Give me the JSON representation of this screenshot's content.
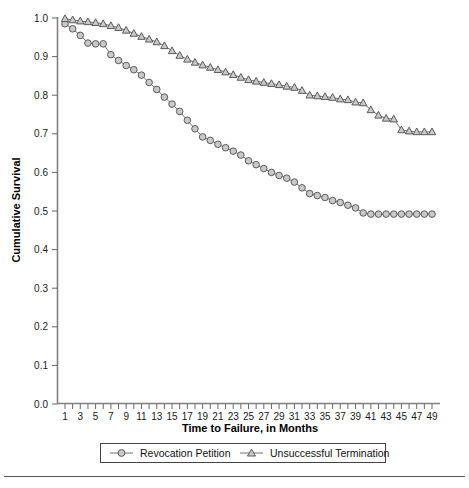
{
  "chart_data": {
    "type": "line",
    "title": "",
    "xlabel": "Time to Failure, in Months",
    "ylabel": "Cumulative Survival",
    "xlim": [
      1,
      49
    ],
    "ylim": [
      0.0,
      1.0
    ],
    "grid": false,
    "legend_position": "bottom",
    "xticks": [
      1,
      2,
      3,
      4,
      5,
      6,
      7,
      8,
      9,
      10,
      11,
      12,
      13,
      14,
      15,
      16,
      17,
      18,
      19,
      20,
      21,
      22,
      23,
      24,
      25,
      26,
      27,
      28,
      29,
      30,
      31,
      32,
      33,
      34,
      35,
      36,
      37,
      38,
      39,
      40,
      41,
      42,
      43,
      44,
      45,
      46,
      47,
      48,
      49
    ],
    "xticklabels": [
      "1",
      "",
      "3",
      "",
      "5",
      "",
      "7",
      "",
      "9",
      "",
      "11",
      "",
      "13",
      "",
      "15",
      "",
      "17",
      "",
      "19",
      "",
      "21",
      "",
      "23",
      "",
      "25",
      "",
      "27",
      "",
      "29",
      "",
      "31",
      "",
      "33",
      "",
      "35",
      "",
      "37",
      "",
      "39",
      "",
      "41",
      "",
      "43",
      "",
      "45",
      "",
      "47",
      "",
      "49"
    ],
    "yticks": [
      0.0,
      0.1,
      0.2,
      0.3,
      0.4,
      0.5,
      0.6,
      0.7,
      0.8,
      0.9,
      1.0
    ],
    "yticklabels": [
      "0.0",
      "0.1",
      "0.2",
      "0.3",
      "0.4",
      "0.5",
      "0.6",
      "0.7",
      "0.8",
      "0.9",
      "1.0"
    ],
    "x": [
      1,
      2,
      3,
      4,
      5,
      6,
      7,
      8,
      9,
      10,
      11,
      12,
      13,
      14,
      15,
      16,
      17,
      18,
      19,
      20,
      21,
      22,
      23,
      24,
      25,
      26,
      27,
      28,
      29,
      30,
      31,
      32,
      33,
      34,
      35,
      36,
      37,
      38,
      39,
      40,
      41,
      42,
      43,
      44,
      45,
      46,
      47,
      48,
      49
    ],
    "series": [
      {
        "name": "Revocation Petition",
        "marker": "circle",
        "color": "#6f6f6f",
        "values": [
          0.985,
          0.972,
          0.955,
          0.935,
          0.933,
          0.933,
          0.905,
          0.89,
          0.877,
          0.866,
          0.852,
          0.833,
          0.815,
          0.795,
          0.777,
          0.758,
          0.735,
          0.713,
          0.692,
          0.683,
          0.673,
          0.664,
          0.655,
          0.645,
          0.63,
          0.62,
          0.61,
          0.6,
          0.592,
          0.585,
          0.575,
          0.56,
          0.545,
          0.54,
          0.535,
          0.527,
          0.522,
          0.515,
          0.508,
          0.495,
          0.492,
          0.492,
          0.492,
          0.492,
          0.492,
          0.492,
          0.492,
          0.492,
          0.492
        ]
      },
      {
        "name": "Unsuccessful Termination",
        "marker": "triangle",
        "color": "#6f6f6f",
        "values": [
          0.998,
          0.995,
          0.992,
          0.99,
          0.988,
          0.985,
          0.98,
          0.975,
          0.968,
          0.96,
          0.952,
          0.945,
          0.938,
          0.928,
          0.915,
          0.903,
          0.893,
          0.885,
          0.878,
          0.872,
          0.866,
          0.86,
          0.853,
          0.846,
          0.84,
          0.836,
          0.833,
          0.83,
          0.827,
          0.823,
          0.82,
          0.812,
          0.8,
          0.798,
          0.796,
          0.794,
          0.79,
          0.788,
          0.782,
          0.78,
          0.762,
          0.748,
          0.74,
          0.738,
          0.71,
          0.707,
          0.705,
          0.705,
          0.705
        ]
      }
    ]
  },
  "legend": {
    "entries": [
      {
        "label": "Revocation Petition",
        "marker": "circle"
      },
      {
        "label": "Unsuccessful Termination",
        "marker": "triangle"
      }
    ]
  },
  "colors": {
    "marker_fill": "#c9c9c9",
    "marker_stroke": "#5a5a5a",
    "line": "#6f6f6f",
    "axis": "#808080",
    "text": "#111111"
  }
}
